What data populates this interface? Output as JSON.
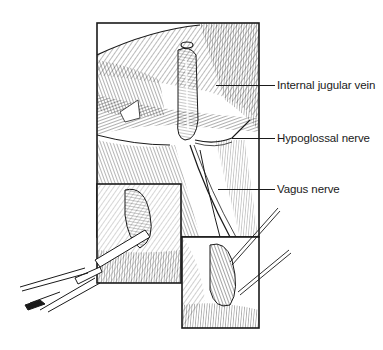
{
  "figure": {
    "type": "surgical anatomical illustration",
    "panels": [
      {
        "id": "main",
        "description": "main operative view"
      },
      {
        "id": "inset-left",
        "description": "lower-left inset with forceps"
      },
      {
        "id": "inset-right",
        "description": "lower-right inset with retractors"
      }
    ],
    "labels": [
      {
        "text": "Internal jugular vein",
        "x": 277,
        "y": 79,
        "leader_from_x": 216,
        "leader_y": 85
      },
      {
        "text": "Hypoglossal nerve",
        "x": 277,
        "y": 132,
        "leader_from_x": 232,
        "leader_y": 138
      },
      {
        "text": "Vagus nerve",
        "x": 277,
        "y": 183,
        "leader_from_x": 218,
        "leader_y": 189
      }
    ],
    "colors": {
      "ink": "#1a1a1a",
      "paper": "#ffffff",
      "shade": "#dcdcdc"
    }
  }
}
